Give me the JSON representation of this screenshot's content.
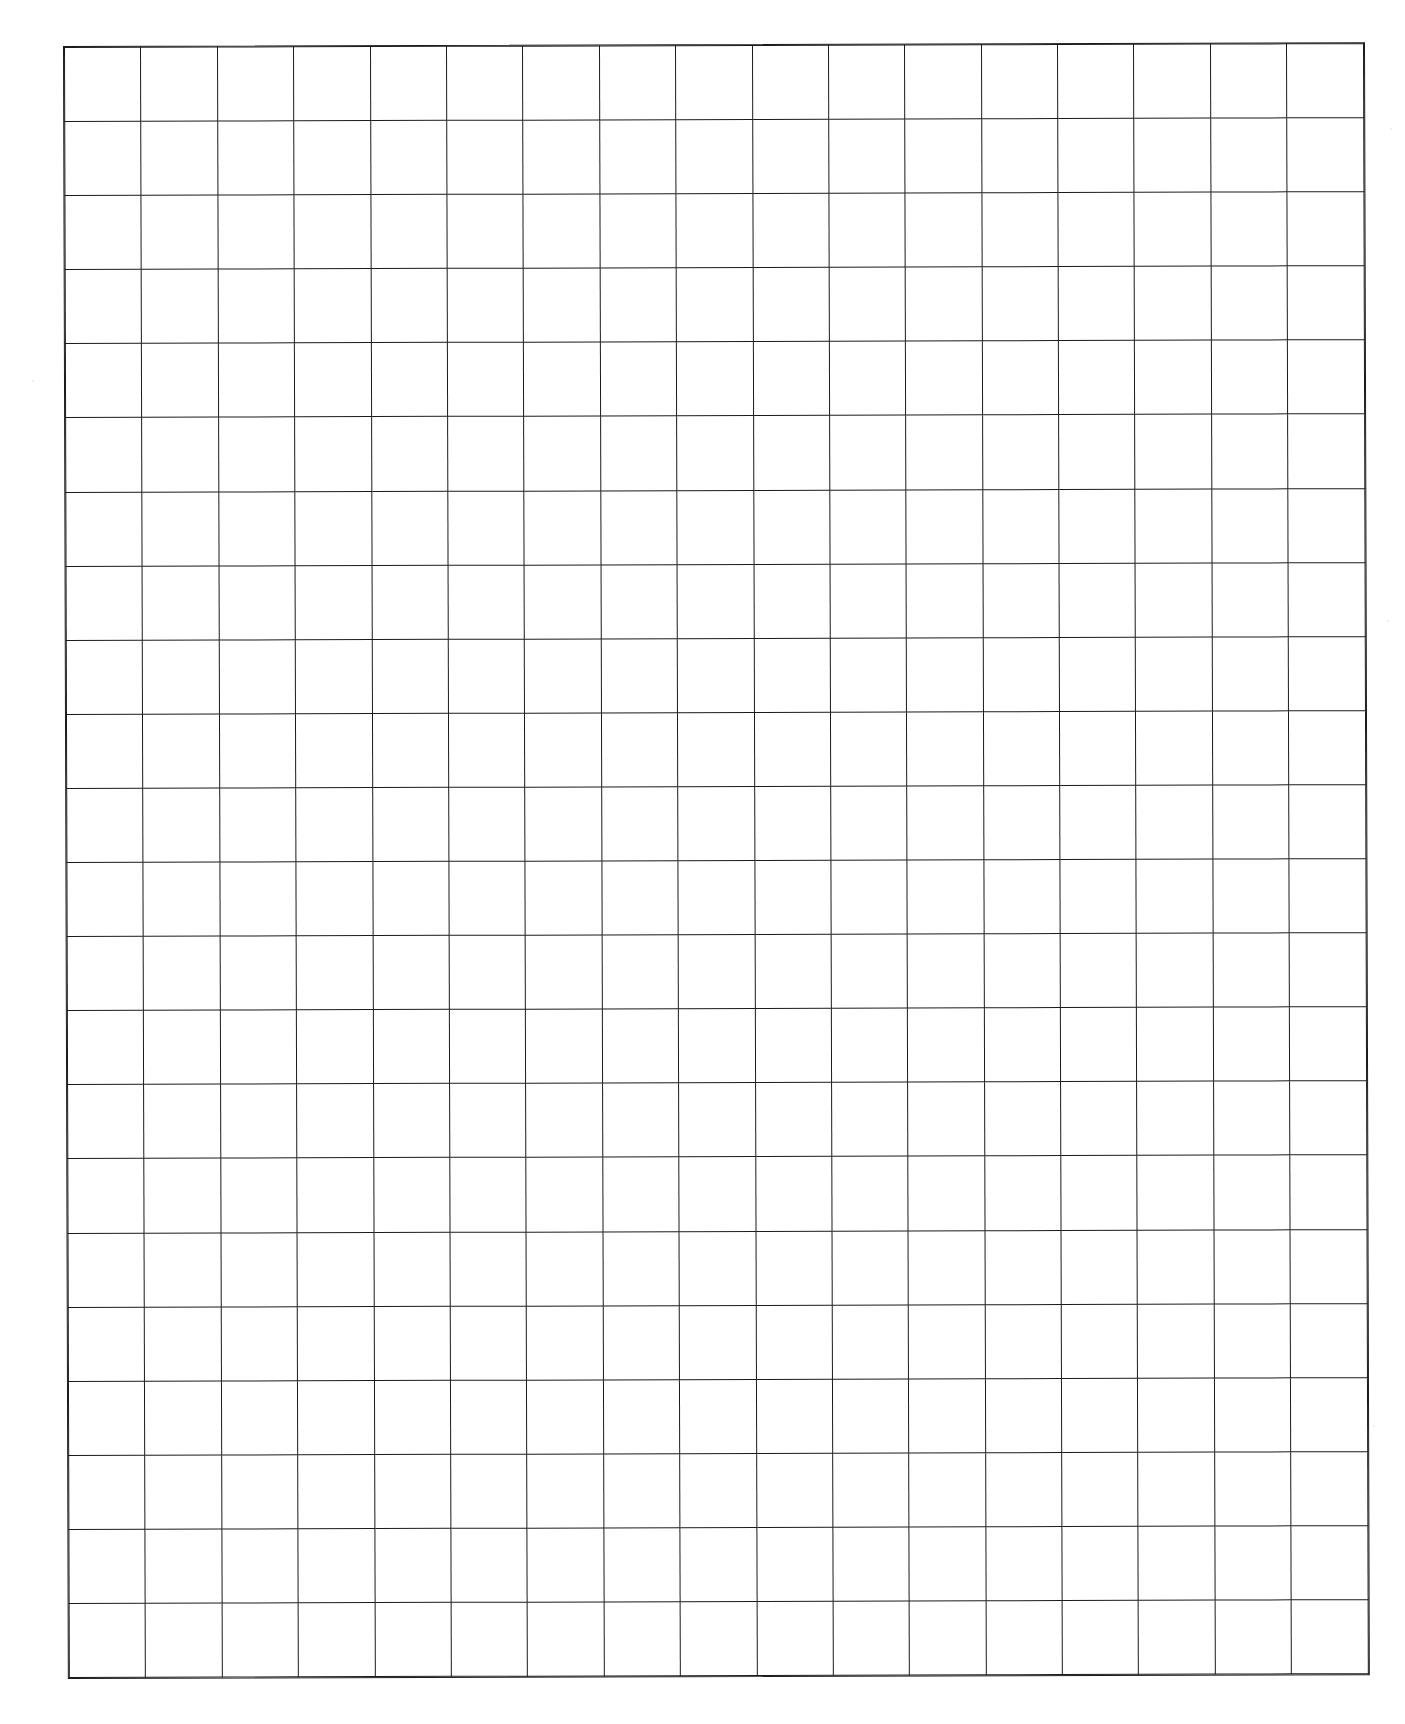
{
  "document": {
    "type": "graph-paper",
    "title": "Blank Graph Paper Grid",
    "description": "Scanned blank grid / graph paper sheet with no printed text, labels, numbers or annotations.",
    "background_color": "#ffffff",
    "line_color": "#1b1b1b",
    "page": {
      "width": 1405,
      "height": 1724
    }
  },
  "grid": {
    "columns": 17,
    "rows": 22,
    "cell_width": 75.4,
    "cell_height": 73.1,
    "line_width": 1.1,
    "border_width": 1.2,
    "offset_left": 64,
    "offset_top": 47,
    "total_width": 1282,
    "total_height": 1608,
    "cell_fill": "#ffffff",
    "skew_degrees": -0.17
  },
  "content": {
    "cells": [],
    "labels": [],
    "annotations": []
  },
  "speckles": [
    {
      "x": 112,
      "y": 95,
      "size": 2
    },
    {
      "x": 1255,
      "y": 186,
      "size": 2
    },
    {
      "x": 318,
      "y": 97,
      "size": 2
    },
    {
      "x": 1262,
      "y": 177,
      "size": 1
    },
    {
      "x": 91,
      "y": 268,
      "size": 2
    },
    {
      "x": 1390,
      "y": 128,
      "size": 2
    },
    {
      "x": 1387,
      "y": 620,
      "size": 2
    },
    {
      "x": 1299,
      "y": 604,
      "size": 2
    },
    {
      "x": 760,
      "y": 580,
      "size": 2
    },
    {
      "x": 112,
      "y": 1047,
      "size": 2
    },
    {
      "x": 586,
      "y": 1140,
      "size": 2
    },
    {
      "x": 311,
      "y": 1190,
      "size": 2
    },
    {
      "x": 1090,
      "y": 1290,
      "size": 2
    },
    {
      "x": 108,
      "y": 1425,
      "size": 2
    },
    {
      "x": 1096,
      "y": 1490,
      "size": 2
    },
    {
      "x": 1373,
      "y": 1425,
      "size": 2
    },
    {
      "x": 32,
      "y": 380,
      "size": 2
    }
  ]
}
